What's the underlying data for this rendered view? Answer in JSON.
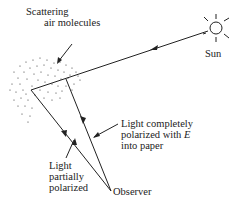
{
  "figure": {
    "labels": {
      "scattering_line1": "Scattering",
      "scattering_line2": "air molecules",
      "sun": "Sun",
      "complete_line1": "Light completely",
      "complete_line2_prefix": "polarized with ",
      "complete_line2_var": "E",
      "complete_line3": "into paper",
      "partial_line1": "Light",
      "partial_line2": "partially",
      "partial_line3": "polarized",
      "observer": "Observer"
    },
    "colors": {
      "ink": "#222222",
      "background": "#ffffff"
    }
  }
}
